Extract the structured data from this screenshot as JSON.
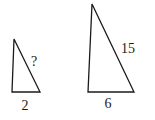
{
  "diagram": {
    "type": "similar-triangles",
    "stroke_color": "#1a1a1a",
    "background": "#ffffff",
    "triangles": [
      {
        "name": "small",
        "points": [
          [
            14,
            39
          ],
          [
            12,
            92
          ],
          [
            40,
            92
          ]
        ],
        "labels": {
          "hypotenuse": "?",
          "base": "2"
        }
      },
      {
        "name": "large",
        "points": [
          [
            92,
            4
          ],
          [
            88,
            92
          ],
          [
            134,
            92
          ]
        ],
        "labels": {
          "hypotenuse": "15",
          "base": "6"
        }
      }
    ]
  }
}
